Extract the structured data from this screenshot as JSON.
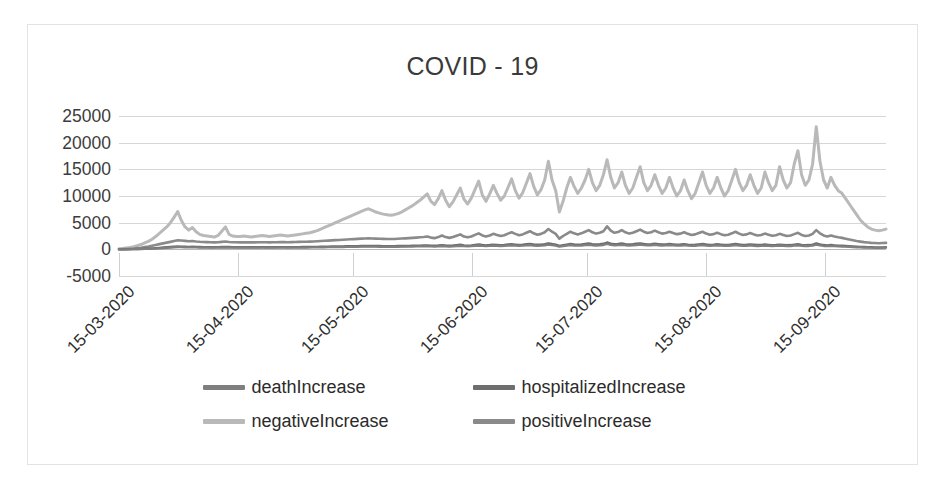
{
  "chart": {
    "title": "COVID - 19",
    "frame_border_color": "#e3e3e3",
    "grid_color": "#d6d6d6"
  },
  "legend": {
    "rows": [
      [
        {
          "label": "deathIncrease",
          "color": "#7f7f7f"
        },
        {
          "label": "hospitalizedIncrease",
          "color": "#6e6e6e"
        }
      ],
      [
        {
          "label": "negativeIncrease",
          "color": "#b9b9b9"
        },
        {
          "label": "positiveIncrease",
          "color": "#8a8a8a"
        }
      ]
    ]
  },
  "chart_data": {
    "type": "line",
    "title": "COVID - 19",
    "xlabel": "",
    "ylabel": "",
    "ylim": [
      -5000,
      25000
    ],
    "yticks": [
      25000,
      20000,
      15000,
      10000,
      5000,
      0,
      -5000
    ],
    "ytick_labels": [
      "25000",
      "20000",
      "15000",
      "10000",
      "5000",
      "0",
      "-5000"
    ],
    "grid": true,
    "legend_position": "bottom",
    "x_tick_labels": [
      "15-03-2020",
      "15-04-2020",
      "15-05-2020",
      "15-06-2020",
      "15-07-2020",
      "15-08-2020",
      "15-09-2020"
    ],
    "x_tick_positions": [
      0,
      31,
      61,
      92,
      122,
      153,
      184
    ],
    "x_range": [
      0,
      200
    ],
    "series": [
      {
        "name": "negativeIncrease",
        "color": "#b9b9b9",
        "width": 3.0,
        "values": [
          120,
          180,
          260,
          340,
          500,
          700,
          900,
          1200,
          1500,
          1900,
          2400,
          3000,
          3600,
          4200,
          5000,
          6000,
          7100,
          5400,
          4200,
          3600,
          4100,
          3300,
          2800,
          2600,
          2500,
          2400,
          2300,
          2600,
          3400,
          4200,
          2800,
          2500,
          2400,
          2400,
          2500,
          2400,
          2300,
          2400,
          2500,
          2600,
          2500,
          2400,
          2500,
          2600,
          2700,
          2600,
          2500,
          2600,
          2700,
          2800,
          2900,
          3000,
          3100,
          3300,
          3500,
          3800,
          4100,
          4400,
          4700,
          5000,
          5300,
          5600,
          5900,
          6200,
          6500,
          6800,
          7100,
          7400,
          7600,
          7300,
          7000,
          6800,
          6600,
          6500,
          6400,
          6500,
          6700,
          7000,
          7400,
          7800,
          8200,
          8700,
          9200,
          9800,
          10400,
          9000,
          8400,
          9500,
          11000,
          9200,
          8000,
          8900,
          10200,
          11500,
          9400,
          8500,
          9600,
          11200,
          12800,
          10200,
          9000,
          10400,
          12000,
          10500,
          9200,
          10000,
          11600,
          13200,
          11000,
          9600,
          10600,
          12400,
          14200,
          11800,
          10200,
          11200,
          13000,
          16500,
          13000,
          11000,
          7000,
          9000,
          11500,
          13500,
          11800,
          10500,
          11500,
          13000,
          15000,
          12500,
          11000,
          12000,
          14000,
          16800,
          13500,
          11500,
          12500,
          14500,
          12000,
          10500,
          11500,
          13500,
          15500,
          12500,
          11000,
          12000,
          14000,
          12000,
          10500,
          11500,
          13500,
          11500,
          10000,
          11000,
          13000,
          11000,
          9500,
          10500,
          12500,
          14500,
          12000,
          10500,
          11500,
          13500,
          11500,
          10000,
          11000,
          13000,
          15000,
          12500,
          11000,
          12000,
          14000,
          12000,
          10500,
          11500,
          14500,
          12500,
          11000,
          12000,
          15500,
          13000,
          11500,
          12500,
          16000,
          18500,
          14000,
          12000,
          13000,
          16000,
          23000,
          16500,
          13000,
          11500,
          13500,
          12000,
          11000,
          10500,
          9500,
          8500,
          7500,
          6500,
          5500,
          4800,
          4200,
          3800,
          3600,
          3500,
          3600,
          3800
        ]
      },
      {
        "name": "positiveIncrease",
        "color": "#8a8a8a",
        "width": 2.6,
        "values": [
          20,
          40,
          70,
          110,
          160,
          230,
          310,
          420,
          540,
          680,
          830,
          980,
          1120,
          1260,
          1400,
          1550,
          1700,
          1650,
          1580,
          1520,
          1560,
          1480,
          1420,
          1380,
          1350,
          1320,
          1300,
          1330,
          1400,
          1460,
          1380,
          1340,
          1320,
          1310,
          1320,
          1310,
          1300,
          1310,
          1320,
          1330,
          1320,
          1310,
          1320,
          1340,
          1360,
          1350,
          1340,
          1350,
          1370,
          1390,
          1410,
          1430,
          1450,
          1480,
          1510,
          1550,
          1600,
          1640,
          1680,
          1720,
          1760,
          1800,
          1840,
          1880,
          1920,
          1960,
          2000,
          2040,
          2060,
          2030,
          2000,
          1980,
          1960,
          1950,
          1940,
          1950,
          1980,
          2020,
          2060,
          2100,
          2150,
          2200,
          2260,
          2320,
          2400,
          2200,
          2100,
          2300,
          2600,
          2300,
          2150,
          2300,
          2550,
          2800,
          2400,
          2250,
          2400,
          2700,
          3000,
          2600,
          2400,
          2600,
          2900,
          2700,
          2500,
          2650,
          2950,
          3200,
          2900,
          2650,
          2800,
          3100,
          3400,
          3000,
          2750,
          2900,
          3200,
          3800,
          3300,
          2900,
          2000,
          2500,
          2900,
          3300,
          3000,
          2800,
          3000,
          3300,
          3600,
          3200,
          2950,
          3100,
          3400,
          4300,
          3500,
          3100,
          3250,
          3600,
          3200,
          2950,
          3100,
          3400,
          3700,
          3300,
          3050,
          3200,
          3500,
          3200,
          2950,
          3050,
          3300,
          3050,
          2850,
          2950,
          3200,
          2900,
          2700,
          2800,
          3050,
          3300,
          2950,
          2750,
          2850,
          3100,
          2850,
          2650,
          2750,
          3000,
          3300,
          2950,
          2700,
          2800,
          3050,
          2800,
          2600,
          2700,
          2950,
          2750,
          2550,
          2650,
          2900,
          2700,
          2500,
          2600,
          2850,
          3100,
          2700,
          2500,
          2600,
          2900,
          3600,
          3000,
          2600,
          2400,
          2600,
          2400,
          2250,
          2150,
          2000,
          1850,
          1700,
          1550,
          1450,
          1350,
          1280,
          1220,
          1180,
          1150,
          1180,
          1220
        ]
      },
      {
        "name": "hospitalizedIncrease",
        "color": "#6e6e6e",
        "width": 2.4,
        "values": [
          5,
          10,
          18,
          28,
          42,
          60,
          82,
          110,
          145,
          185,
          230,
          280,
          330,
          380,
          430,
          480,
          530,
          510,
          490,
          470,
          485,
          455,
          435,
          420,
          410,
          400,
          395,
          405,
          430,
          455,
          425,
          410,
          400,
          395,
          400,
          395,
          390,
          395,
          400,
          405,
          400,
          395,
          400,
          405,
          412,
          408,
          402,
          408,
          415,
          422,
          428,
          435,
          442,
          452,
          462,
          475,
          490,
          505,
          520,
          532,
          545,
          558,
          570,
          582,
          595,
          608,
          620,
          632,
          640,
          630,
          620,
          612,
          605,
          600,
          598,
          602,
          612,
          625,
          638,
          652,
          668,
          684,
          702,
          722,
          745,
          690,
          660,
          710,
          790,
          715,
          670,
          715,
          785,
          855,
          745,
          700,
          745,
          830,
          905,
          805,
          745,
          805,
          890,
          835,
          775,
          820,
          900,
          965,
          885,
          820,
          865,
          945,
          1025,
          915,
          848,
          890,
          970,
          1130,
          1000,
          890,
          640,
          780,
          895,
          1005,
          920,
          862,
          920,
          1005,
          1090,
          980,
          905,
          950,
          1035,
          1280,
          1065,
          955,
          995,
          1095,
          980,
          905,
          950,
          1035,
          1120,
          1010,
          935,
          980,
          1065,
          980,
          905,
          935,
          1010,
          935,
          875,
          905,
          980,
          890,
          830,
          860,
          935,
          1010,
          905,
          845,
          875,
          950,
          875,
          815,
          845,
          920,
          1010,
          905,
          830,
          860,
          935,
          860,
          800,
          830,
          905,
          845,
          785,
          815,
          890,
          830,
          770,
          800,
          875,
          950,
          830,
          770,
          800,
          890,
          1100,
          920,
          800,
          740,
          800,
          740,
          695,
          665,
          620,
          575,
          530,
          485,
          455,
          425,
          405,
          385,
          375,
          365,
          375,
          385
        ]
      },
      {
        "name": "deathIncrease",
        "color": "#7f7f7f",
        "width": 2.2,
        "values": [
          2,
          4,
          8,
          14,
          22,
          34,
          48,
          66,
          88,
          115,
          148,
          185,
          225,
          268,
          312,
          358,
          405,
          390,
          372,
          358,
          368,
          348,
          332,
          322,
          315,
          308,
          302,
          310,
          328,
          345,
          325,
          315,
          308,
          305,
          308,
          305,
          300,
          305,
          308,
          312,
          308,
          302,
          308,
          312,
          318,
          315,
          310,
          315,
          320,
          326,
          330,
          336,
          342,
          350,
          358,
          368,
          380,
          392,
          402,
          412,
          422,
          432,
          442,
          452,
          462,
          472,
          482,
          490,
          496,
          488,
          480,
          474,
          468,
          464,
          462,
          466,
          474,
          484,
          494,
          506,
          518,
          530,
          544,
          560,
          578,
          535,
          512,
          550,
          612,
          554,
          520,
          554,
          608,
          662,
          578,
          542,
          578,
          644,
          702,
          624,
          578,
          624,
          690,
          648,
          602,
          636,
          698,
          748,
          686,
          636,
          670,
          732,
          794,
          710,
          658,
          690,
          752,
          876,
          776,
          690,
          496,
          605,
          694,
          779,
          713,
          668,
          713,
          779,
          845,
          760,
          702,
          736,
          802,
          992,
          826,
          740,
          772,
          849,
          760,
          702,
          736,
          802,
          868,
          783,
          725,
          760,
          826,
          760,
          702,
          725,
          783,
          725,
          679,
          702,
          760,
          690,
          643,
          667,
          725,
          783,
          702,
          655,
          679,
          736,
          679,
          632,
          655,
          713,
          783,
          702,
          643,
          667,
          725,
          667,
          620,
          643,
          702,
          655,
          609,
          632,
          690,
          643,
          597,
          620,
          679,
          736,
          643,
          597,
          620,
          690,
          853,
          713,
          620,
          574,
          620,
          574,
          539,
          516,
          481,
          446,
          411,
          376,
          353,
          330,
          314,
          299,
          291,
          283,
          291,
          299
        ]
      }
    ]
  }
}
